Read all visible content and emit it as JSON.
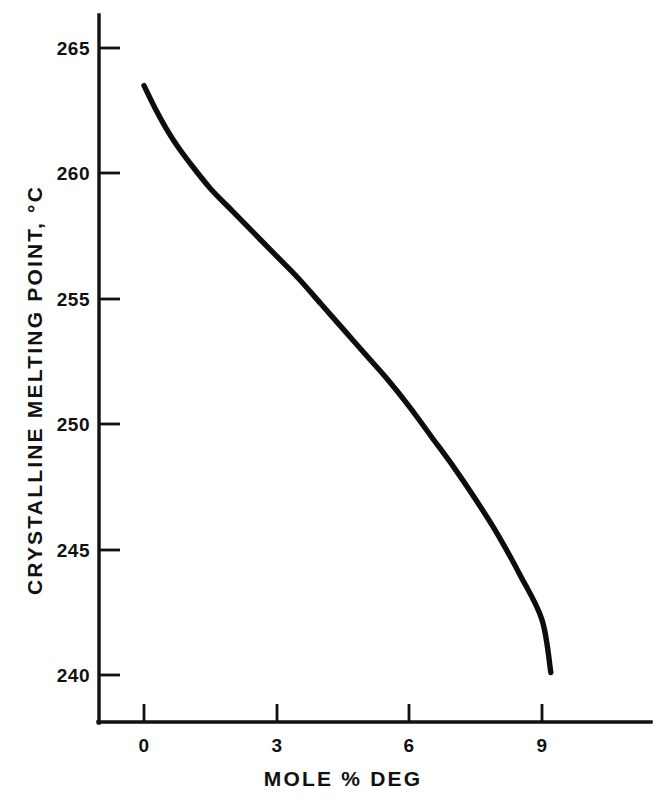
{
  "chart_data": {
    "type": "line",
    "title": "",
    "subtitle": "",
    "xlabel": "MOLE % DEG",
    "ylabel": "CRYSTALLINE MELTING POINT, °C",
    "xlim": [
      -1.05,
      11.45
    ],
    "ylim": [
      237.4,
      266.05
    ],
    "xticks": [
      0,
      3,
      6,
      9
    ],
    "xtick_labels": [
      "0",
      "3",
      "6",
      "9"
    ],
    "yticks": [
      240,
      245,
      250,
      255,
      260,
      265
    ],
    "ytick_labels": [
      "240",
      "245",
      "250",
      "255",
      "260",
      "265"
    ],
    "grid": false,
    "legend": null,
    "legend_position": "none",
    "annotations": [],
    "series": [
      {
        "name": "crystalline melting point",
        "color": "#0d0d0d",
        "line_width": 5.4,
        "marker": "none",
        "x": [
          0.0,
          0.25,
          0.5,
          0.75,
          1.0,
          1.5,
          2.0,
          2.5,
          3.0,
          3.5,
          4.0,
          4.5,
          5.0,
          5.5,
          6.0,
          6.5,
          7.0,
          7.5,
          8.0,
          8.5,
          9.0,
          9.2
        ],
        "y": [
          263.5,
          262.6,
          261.8,
          261.1,
          260.5,
          259.4,
          258.5,
          257.6,
          256.7,
          255.8,
          254.8,
          253.8,
          252.8,
          251.8,
          250.7,
          249.5,
          248.3,
          247.0,
          245.6,
          244.0,
          242.2,
          240.1
        ]
      }
    ]
  },
  "axes": {
    "x_axis_name": "mole-percent-deg-axis",
    "y_axis_name": "crystalline-melting-point-axis"
  }
}
